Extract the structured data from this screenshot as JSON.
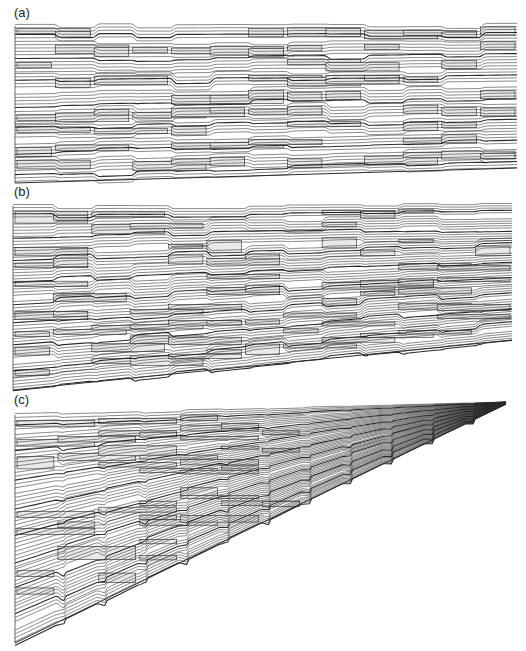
{
  "figure": {
    "panels": [
      {
        "id": "a",
        "label": "(a)",
        "layout": "rectangular-slanted-bottom",
        "line_count": 48,
        "block_rows": 9,
        "columns": 13
      },
      {
        "id": "b",
        "label": "(b)",
        "layout": "rectangular-slanted-bottom",
        "line_count": 60,
        "block_rows": 10,
        "columns": 13
      },
      {
        "id": "c",
        "label": "(c)",
        "layout": "converging-wedge",
        "line_count": 60,
        "block_rows": 11,
        "columns": 12
      }
    ],
    "colors": {
      "line": "#2a2a2a",
      "block_fill": "#ececec",
      "stipple": "#b8b8b8",
      "background": "#ffffff"
    }
  }
}
